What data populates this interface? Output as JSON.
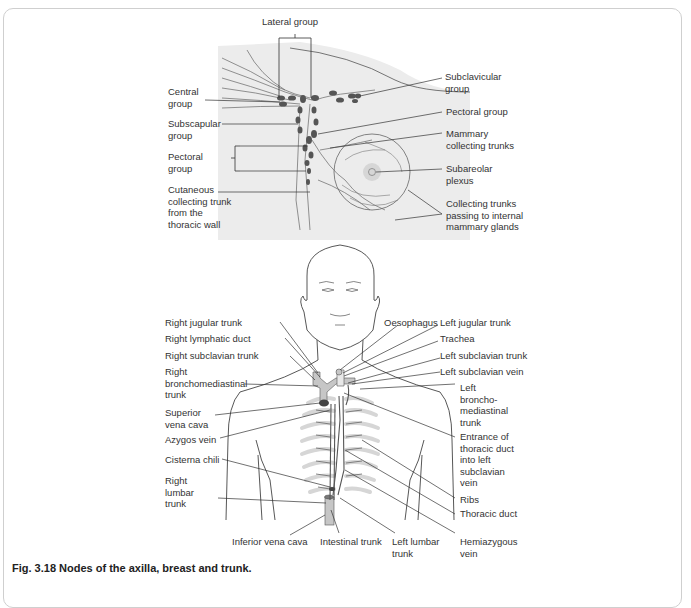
{
  "figure": {
    "caption": "Fig. 3.18  Nodes of the axilla, breast and trunk."
  },
  "axilla_diagram": {
    "labels": {
      "lateral_group": "Lateral group",
      "central_group": [
        "Central",
        "group"
      ],
      "subscapular_group": [
        "Subscapular",
        "group"
      ],
      "pectoral_group_left": [
        "Pectoral",
        "group"
      ],
      "cutaneous_trunk": [
        "Cutaneous",
        "collecting trunk",
        "from the",
        "thoracic wall"
      ],
      "subclavicular_group": [
        "Subclavicular",
        "group"
      ],
      "pectoral_group_right": "Pectoral group",
      "mammary_trunks": [
        "Mammary",
        "collecting trunks"
      ],
      "subareolar_plexus": [
        "Subareolar",
        "plexus"
      ],
      "collecting_trunks_internal": [
        "Collecting trunks",
        "passing to internal",
        "mammary glands"
      ]
    }
  },
  "trunk_diagram": {
    "labels": {
      "right_jugular_trunk": "Right jugular trunk",
      "right_lymphatic_duct": "Right lymphatic duct",
      "right_subclavian_trunk": "Right subclavian trunk",
      "right_bronchomediastinal_trunk": [
        "Right",
        "bronchomediastinal",
        "trunk"
      ],
      "superior_vena_cava": [
        "Superior",
        "vena cava"
      ],
      "azygos_vein": "Azygos vein",
      "cisterna_chili": "Cisterna chili",
      "right_lumbar_trunk": [
        "Right",
        "lumbar",
        "trunk"
      ],
      "inferior_vena_cava": "Inferior vena cava",
      "intestinal_trunk": "Intestinal trunk",
      "left_lumbar_trunk": [
        "Left lumbar",
        "trunk"
      ],
      "oesophagus": "Oesophagus",
      "left_jugular_trunk": "Left jugular trunk",
      "trachea": "Trachea",
      "left_subclavian_trunk": "Left subclavian trunk",
      "left_subclavian_vein": "Left subclavian vein",
      "left_bronchomediastinal_trunk": [
        "Left",
        "broncho-",
        "mediastinal",
        "trunk"
      ],
      "entrance_thoracic_duct": [
        "Entrance of",
        "thoracic duct",
        "into left",
        "subclavian",
        "vein"
      ],
      "ribs": "Ribs",
      "thoracic_duct": "Thoracic duct",
      "hemiazygous_vein": [
        "Hemiazygous",
        "vein"
      ]
    }
  },
  "colors": {
    "background": "#ffffff",
    "panel_shade": "#ebebeb",
    "line": "#444444",
    "node": "#555555",
    "rib": "#d4d4d4",
    "vessel": "#c8c8c8",
    "text": "#333333"
  }
}
